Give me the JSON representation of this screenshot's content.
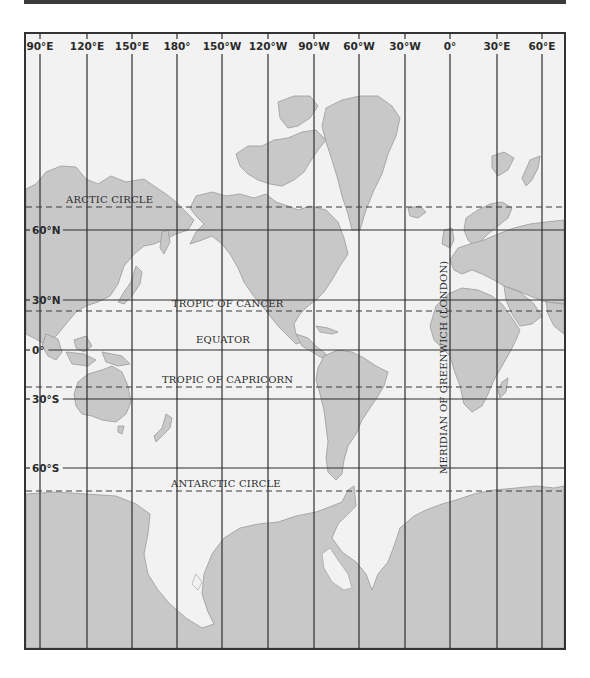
{
  "map": {
    "title": "World Mercator Grid",
    "colors": {
      "ocean": "#f2f2f2",
      "land": "#c8c8c8",
      "land_edge": "#9a9a9a",
      "grid": "#2e2e2e",
      "frame": "#333333",
      "topbar": "#3a3a3a"
    },
    "meridians": [
      {
        "label": "90°E",
        "x": 14
      },
      {
        "label": "120°E",
        "x": 61
      },
      {
        "label": "150°E",
        "x": 106
      },
      {
        "label": "180°",
        "x": 151
      },
      {
        "label": "150°W",
        "x": 196
      },
      {
        "label": "120°W",
        "x": 242
      },
      {
        "label": "90°W",
        "x": 288
      },
      {
        "label": "60°W",
        "x": 333
      },
      {
        "label": "30°W",
        "x": 379
      },
      {
        "label": "0°",
        "x": 424
      },
      {
        "label": "30°E",
        "x": 471
      },
      {
        "label": "60°E",
        "x": 516
      }
    ],
    "parallels": [
      {
        "label": "60°N",
        "y": 196
      },
      {
        "label": "30°N",
        "y": 266
      },
      {
        "label": "0°",
        "y": 316
      },
      {
        "label": "30°S",
        "y": 365
      },
      {
        "label": "60°S",
        "y": 434
      }
    ],
    "special_circles": [
      {
        "label": "ARCTIC CIRCLE",
        "y": 173,
        "label_x": 40
      },
      {
        "label": "TROPIC OF CANCER",
        "y": 277,
        "label_x": 146
      },
      {
        "label": "EQUATOR",
        "y": 316,
        "label_x": 170,
        "solid": true
      },
      {
        "label": "TROPIC OF CAPRICORN",
        "y": 353,
        "label_x": 136
      },
      {
        "label": "ANTARCTIC CIRCLE",
        "y": 457,
        "label_x": 145
      }
    ],
    "prime_meridian_label": "MERIDIAN OF GREENWICH (LONDON)"
  }
}
